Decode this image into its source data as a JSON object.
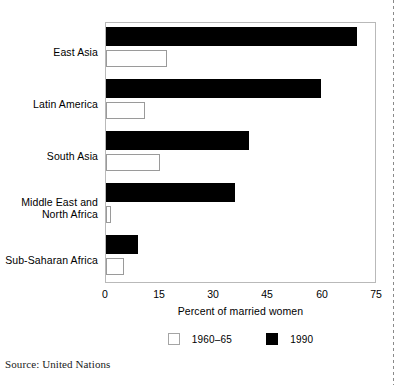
{
  "chart_data": {
    "type": "bar",
    "orientation": "horizontal",
    "title": "",
    "xlabel": "Percent of married women",
    "ylabel": "",
    "xlim": [
      0,
      75
    ],
    "xticks": [
      0,
      15,
      30,
      45,
      60,
      75
    ],
    "xtick_labels": [
      "0",
      "15",
      "30",
      "45",
      "60",
      "75"
    ],
    "grid": false,
    "legend_position": "bottom-center",
    "categories": [
      "East Asia",
      "Latin America",
      "South Asia",
      "Middle East and North Africa",
      "Sub-Saharan Africa"
    ],
    "series": [
      {
        "name": "1960–65",
        "color": "#ffffff",
        "edge_color": "#9a9a9a",
        "values": [
          17,
          11,
          15,
          1.5,
          5
        ]
      },
      {
        "name": "1990",
        "color": "#000000",
        "edge_color": "#000000",
        "values": [
          70,
          60,
          40,
          36,
          9
        ]
      }
    ]
  },
  "axis": {
    "x_title": "Percent of married women",
    "tick_labels": [
      "0",
      "15",
      "30",
      "45",
      "60",
      "75"
    ]
  },
  "category_labels": [
    {
      "line1": "East Asia",
      "line2": ""
    },
    {
      "line1": "Latin America",
      "line2": ""
    },
    {
      "line1": "South Asia",
      "line2": ""
    },
    {
      "line1": "Middle East and",
      "line2": "North Africa"
    },
    {
      "line1": "Sub-Saharan Africa",
      "line2": ""
    }
  ],
  "legend": {
    "items": [
      {
        "label": "1960–65",
        "swatch": "open-square-swatch"
      },
      {
        "label": "1990",
        "swatch": "filled-square-swatch"
      }
    ]
  },
  "source": {
    "text": "Source: United Nations"
  },
  "colors": {
    "series_1960_fill": "#ffffff",
    "series_1960_edge": "#9a9a9a",
    "series_1990_fill": "#000000",
    "frame": "#b9b9b9",
    "text": "#000000",
    "background": "#ffffff"
  }
}
